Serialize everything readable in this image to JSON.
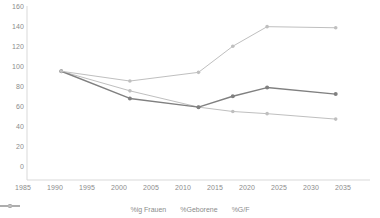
{
  "chart_data": {
    "type": "line",
    "title": "",
    "xlabel": "",
    "ylabel": "",
    "xlim": [
      1985,
      2035
    ],
    "ylim": [
      0,
      160
    ],
    "xticks": [
      1985,
      1990,
      1995,
      2000,
      2005,
      2010,
      2015,
      2020,
      2025,
      2030,
      2035
    ],
    "yticks": [
      0,
      20,
      40,
      60,
      80,
      100,
      120,
      140,
      160
    ],
    "grid": false,
    "legend_position": "bottom",
    "x": [
      1990,
      2000,
      2010,
      2015,
      2020,
      2030
    ],
    "series": [
      {
        "name": "%ig Frauen",
        "color": "#bfbfbf",
        "values": [
          100,
          82,
          67,
          63,
          61,
          56
        ]
      },
      {
        "name": "%Geborene",
        "color": "#808080",
        "values": [
          100,
          75,
          67,
          77,
          85,
          79
        ]
      },
      {
        "name": "%G/F",
        "color": "#bfbfbf",
        "values": [
          100,
          91,
          99,
          123,
          141,
          140
        ]
      }
    ]
  },
  "axes": {
    "y_tick_labels": [
      "160",
      "140",
      "120",
      "100",
      "80",
      "60",
      "40",
      "20",
      "0"
    ],
    "x_tick_labels": [
      "1985",
      "1990",
      "1995",
      "2000",
      "2005",
      "2010",
      "2015",
      "2020",
      "2025",
      "2030",
      "2035"
    ]
  },
  "legend": {
    "items": [
      {
        "label": "%ig Frauen"
      },
      {
        "label": "%Geborene"
      },
      {
        "label": "%G/F"
      }
    ]
  },
  "colors": {
    "axis": "#d9d9d9",
    "tick_text": "#8c8c8c",
    "series_light": "#bfbfbf",
    "series_dark": "#808080",
    "background": "#ffffff"
  }
}
